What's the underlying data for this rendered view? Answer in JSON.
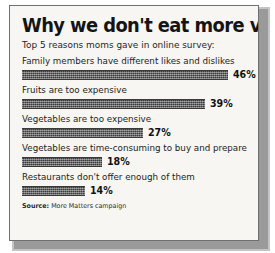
{
  "figure": {
    "title": "Why we don't eat more veggies",
    "subtitle": "Top 5 reasons moms gave in online survey:",
    "source_label": "Source:",
    "source_text": "More  Matters campaign",
    "bar_color": "#4f4f4f",
    "panel_background": "#f7f6f3",
    "border_color": "#6f6f6f"
  },
  "chart_data": {
    "type": "bar",
    "orientation": "horizontal",
    "title": "Why we don't eat more veggies",
    "subtitle": "Top 5 reasons moms gave in online survey:",
    "xlabel": "",
    "ylabel": "",
    "xlim": [
      0,
      50
    ],
    "grid": false,
    "legend": null,
    "value_suffix": "%",
    "source": "Source: More  Matters campaign",
    "categories": [
      "Family members have different likes and dislikes",
      "Fruits are too expensive",
      "Vegetables are too expensive",
      "Vegetables are time-consuming to buy and prepare",
      "Restaurants don't offer enough of them"
    ],
    "values": [
      46,
      39,
      27,
      18,
      14
    ],
    "labels": [
      "46%",
      "39%",
      "27%",
      "18%",
      "14%"
    ],
    "bars": [
      {
        "label": "Family members have different likes and dislikes",
        "value": 46,
        "value_label": "46%",
        "pixel_width": 206
      },
      {
        "label": "Fruits are too expensive",
        "value": 39,
        "value_label": "39%",
        "pixel_width": 183
      },
      {
        "label": "Vegetables are too expensive",
        "value": 27,
        "value_label": "27%",
        "pixel_width": 121
      },
      {
        "label": "Vegetables are time-consuming to buy and prepare",
        "value": 18,
        "value_label": "18%",
        "pixel_width": 80
      },
      {
        "label": "Restaurants don't offer enough of them",
        "value": 14,
        "value_label": "14%",
        "pixel_width": 63
      }
    ]
  }
}
